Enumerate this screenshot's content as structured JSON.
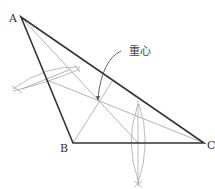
{
  "diagram": {
    "vertices": {
      "A": {
        "label": "A",
        "x": 21,
        "y": 17
      },
      "B": {
        "label": "B",
        "x": 73,
        "y": 143
      },
      "C": {
        "label": "C",
        "x": 204,
        "y": 143
      }
    },
    "annotation": {
      "label": "重心"
    },
    "colors": {
      "triangle": "#333333",
      "construction": "#aaaaaa",
      "arrow": "#555555"
    }
  }
}
